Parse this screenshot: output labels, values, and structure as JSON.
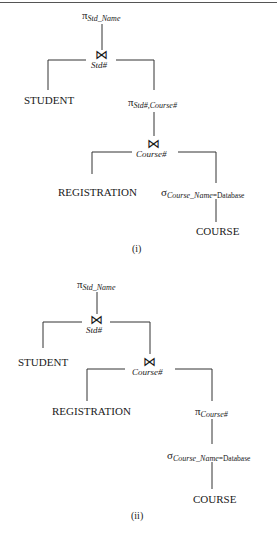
{
  "tree_i": {
    "root_project": {
      "symbol": "π",
      "attrs": "Std_Name"
    },
    "join1": {
      "symbol": "⋈",
      "condition": "Std#"
    },
    "left_leaf": "STUDENT",
    "project2": {
      "symbol": "π",
      "attrs": "Std#,Course#"
    },
    "join2": {
      "symbol": "⋈",
      "condition": "Course#"
    },
    "join2_left": "REGISTRATION",
    "select": {
      "symbol": "σ",
      "attr": "Course_Name",
      "value": "=Database"
    },
    "select_child": "COURSE",
    "caption": "(i)"
  },
  "tree_ii": {
    "root_project": {
      "symbol": "π",
      "attrs": "Std_Name"
    },
    "join1": {
      "symbol": "⋈",
      "condition": "Std#"
    },
    "left_leaf": "STUDENT",
    "join2": {
      "symbol": "⋈",
      "condition": "Course#"
    },
    "join2_left": "REGISTRATION",
    "project2": {
      "symbol": "π",
      "attrs": "Course#"
    },
    "select": {
      "symbol": "σ",
      "attr": "Course_Name",
      "value": "=Database"
    },
    "select_child": "COURSE",
    "caption": "(ii)"
  }
}
